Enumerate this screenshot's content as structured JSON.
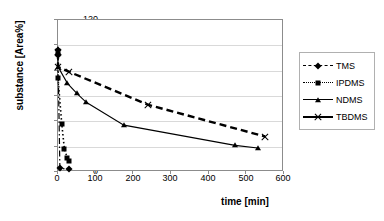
{
  "chart_data": {
    "type": "line",
    "title": "",
    "xlabel": "time [min]",
    "ylabel": "substance [Area%]",
    "xlim": [
      0,
      600
    ],
    "ylim": [
      0,
      120
    ],
    "xticks": [
      0,
      100,
      200,
      300,
      400,
      500,
      600
    ],
    "yticks": [
      0,
      20,
      40,
      60,
      80,
      100,
      120
    ],
    "grid": "horizontal",
    "legend_position": "right",
    "series": [
      {
        "name": "TMS",
        "marker": "diamond",
        "linestyle": "dash-dot",
        "color": "#000000",
        "x": [
          0,
          0,
          5,
          30
        ],
        "y": [
          96,
          92,
          3,
          2
        ]
      },
      {
        "name": "IPDMS",
        "marker": "square",
        "linestyle": "dotted",
        "color": "#000000",
        "x": [
          0,
          0,
          10,
          17,
          25,
          30
        ],
        "y": [
          93,
          74,
          38,
          18,
          11,
          9
        ]
      },
      {
        "name": "NDMS",
        "marker": "triangle",
        "linestyle": "solid",
        "color": "#000000",
        "x": [
          0,
          0,
          25,
          50,
          75,
          175,
          470,
          530
        ],
        "y": [
          97,
          83,
          70,
          62,
          55,
          37,
          21,
          19
        ]
      },
      {
        "name": "TBDMS",
        "marker": "x",
        "linestyle": "dashed",
        "color": "#000000",
        "x": [
          0,
          0,
          30,
          240,
          550
        ],
        "y": [
          95,
          83,
          79,
          53,
          28
        ]
      }
    ]
  },
  "axis": {
    "y_title": "substance [Area%]",
    "x_title": "time [min]",
    "y_tick_labels": [
      "0",
      "20",
      "40",
      "60",
      "80",
      "100",
      "120"
    ],
    "x_tick_labels": [
      "0",
      "100",
      "200",
      "300",
      "400",
      "500",
      "600"
    ]
  },
  "legend": {
    "entries": [
      {
        "label": "TMS"
      },
      {
        "label": "IPDMS"
      },
      {
        "label": "NDMS"
      },
      {
        "label": "TBDMS"
      }
    ]
  }
}
